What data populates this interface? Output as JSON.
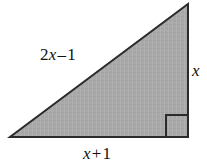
{
  "figure": {
    "background_color": "#ffffff",
    "fill_color": "#a8a8a8",
    "stroke_color": "#2b2b2b",
    "stroke_width": 2,
    "shape": "right triangle",
    "vertices": {
      "top_right": [
        188,
        4
      ],
      "bottom_right": [
        188,
        137
      ],
      "bottom_left": [
        10,
        137
      ]
    },
    "right_angle_marker": {
      "corner": "bottom-right",
      "size": 22,
      "x": 166,
      "y": 115
    }
  },
  "labels": {
    "hypotenuse": {
      "name": "2x - 1",
      "coefficient": "2",
      "variable": "x",
      "operator": "–",
      "constant": "1"
    },
    "vertical_leg": {
      "name": "x",
      "variable": "x"
    },
    "base": {
      "name": "x + 1",
      "variable": "x",
      "operator": "+",
      "constant": "1"
    }
  },
  "chart_data": {
    "type": "diagram",
    "sides": [
      {
        "position": "hypotenuse",
        "label": "2x – 1"
      },
      {
        "position": "vertical-leg-right",
        "label": "x"
      },
      {
        "position": "base-bottom",
        "label": "x + 1"
      }
    ]
  }
}
